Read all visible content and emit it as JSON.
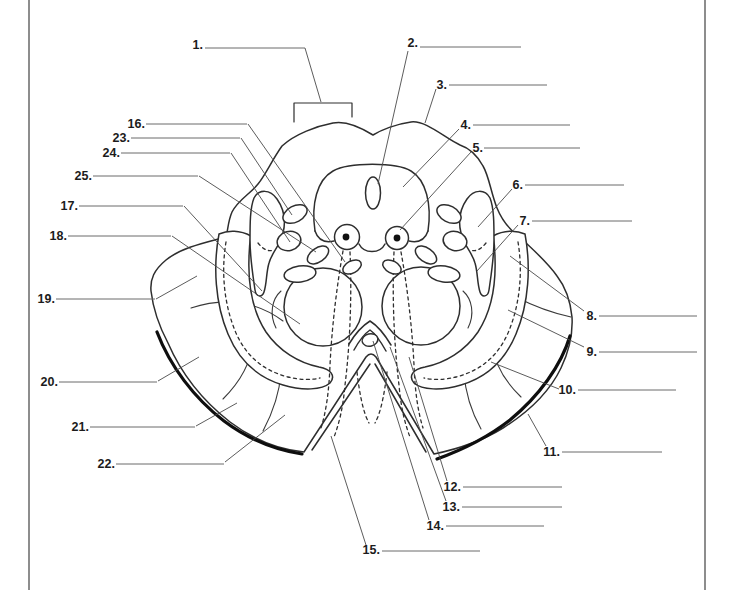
{
  "figure": {
    "colors": {
      "ink": "#2e2e2e",
      "answer_line": "#6a6a6a",
      "leader_line": "#4a4a4a",
      "background": "#ffffff",
      "pia_band": "#0e0e0e"
    }
  },
  "page_rules": {
    "left_x": 28,
    "right_x": 704
  },
  "bracket": {
    "points": "294,122 294,103 352,103 352,117"
  },
  "labels": [
    {
      "n": "1.",
      "num": [
        203,
        49
      ],
      "line": [
        205,
        48,
        305,
        48
      ],
      "leader": [
        305,
        48,
        321,
        102
      ]
    },
    {
      "n": "2.",
      "num": [
        418,
        47
      ],
      "line": [
        420,
        47,
        521,
        47
      ],
      "leader": [
        408,
        51,
        378,
        184
      ]
    },
    {
      "n": "3.",
      "num": [
        447,
        89
      ],
      "line": [
        449,
        85,
        547,
        85
      ],
      "leader": [
        436,
        89,
        425,
        123
      ]
    },
    {
      "n": "4.",
      "num": [
        471,
        129
      ],
      "line": [
        473,
        125,
        570,
        125
      ],
      "leader": [
        459,
        129,
        403,
        187
      ]
    },
    {
      "n": "5.",
      "num": [
        483,
        152
      ],
      "line": [
        484,
        148,
        580,
        148
      ],
      "leader": [
        471,
        152,
        400,
        230
      ]
    },
    {
      "n": "6.",
      "num": [
        523,
        189
      ],
      "line": [
        525,
        185,
        624,
        185
      ],
      "leader": [
        512,
        189,
        478,
        227
      ]
    },
    {
      "n": "7.",
      "num": [
        530,
        225
      ],
      "line": [
        532,
        221,
        632,
        221
      ],
      "leader": [
        518,
        225,
        477,
        271
      ]
    },
    {
      "n": "8.",
      "num": [
        597,
        320
      ],
      "line": [
        599,
        316,
        697,
        316
      ],
      "leader": [
        584,
        311,
        510,
        256
      ]
    },
    {
      "n": "9.",
      "num": [
        597,
        356
      ],
      "line": [
        599,
        352,
        697,
        352
      ],
      "leader": [
        584,
        347,
        508,
        310
      ]
    },
    {
      "n": "10.",
      "num": [
        576,
        394
      ],
      "line": [
        578,
        390,
        676,
        390
      ],
      "leader": [
        559,
        389,
        491,
        362
      ]
    },
    {
      "n": "11.",
      "num": [
        560,
        456
      ],
      "line": [
        562,
        452,
        662,
        452
      ],
      "leader": [
        546,
        446,
        528,
        414
      ]
    },
    {
      "n": "12.",
      "num": [
        461,
        491
      ],
      "line": [
        463,
        487,
        562,
        487
      ],
      "leader": [
        447,
        481,
        409,
        357
      ]
    },
    {
      "n": "13.",
      "num": [
        460,
        511
      ],
      "line": [
        462,
        507,
        562,
        507
      ],
      "leader": [
        446,
        501,
        390,
        347
      ]
    },
    {
      "n": "14.",
      "num": [
        444,
        530
      ],
      "line": [
        446,
        526,
        544,
        526
      ],
      "leader": [
        429,
        520,
        373,
        341
      ]
    },
    {
      "n": "15.",
      "num": [
        380,
        554
      ],
      "line": [
        382,
        551,
        480,
        551
      ],
      "leader": [
        366,
        545,
        331,
        436
      ]
    },
    {
      "n": "16.",
      "num": [
        145,
        128
      ],
      "line": [
        146,
        124,
        247,
        124
      ],
      "leader": [
        248,
        124,
        345,
        262
      ]
    },
    {
      "n": "17.",
      "num": [
        78,
        210
      ],
      "line": [
        79,
        206,
        183,
        206
      ],
      "leader": [
        184,
        206,
        262,
        291
      ]
    },
    {
      "n": "18.",
      "num": [
        67,
        240
      ],
      "line": [
        68,
        236,
        171,
        236
      ],
      "leader": [
        172,
        236,
        300,
        324
      ]
    },
    {
      "n": "19.",
      "num": [
        55,
        303
      ],
      "line": [
        56,
        299,
        155,
        299
      ],
      "leader": [
        156,
        299,
        197,
        276
      ]
    },
    {
      "n": "20.",
      "num": [
        58,
        386
      ],
      "line": [
        59,
        382,
        157,
        382
      ],
      "leader": [
        158,
        381,
        199,
        357
      ]
    },
    {
      "n": "21.",
      "num": [
        89,
        431
      ],
      "line": [
        90,
        427,
        195,
        427
      ],
      "leader": [
        196,
        426,
        237,
        403
      ]
    },
    {
      "n": "22.",
      "num": [
        115,
        468
      ],
      "line": [
        116,
        464,
        224,
        464
      ],
      "leader": [
        225,
        462,
        285,
        415
      ]
    },
    {
      "n": "23.",
      "num": [
        130,
        142
      ],
      "line": [
        131,
        138,
        240,
        138
      ],
      "leader": [
        241,
        138,
        292,
        215
      ]
    },
    {
      "n": "24.",
      "num": [
        120,
        157
      ],
      "line": [
        121,
        153,
        230,
        153
      ],
      "leader": [
        231,
        153,
        290,
        242
      ]
    },
    {
      "n": "25.",
      "num": [
        92,
        180
      ],
      "line": [
        93,
        176,
        198,
        176
      ],
      "leader": [
        199,
        176,
        316,
        252
      ]
    }
  ]
}
